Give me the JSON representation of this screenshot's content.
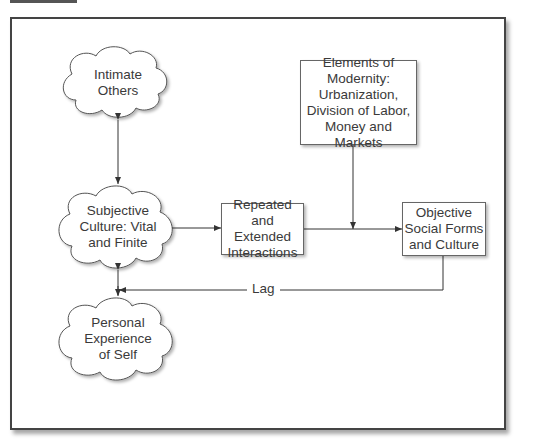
{
  "figure": {
    "header_tab_color": "#555555",
    "frame_border_color": "#444444"
  },
  "nodes": {
    "intimate_others": {
      "shape": "cloud",
      "label": "Intimate Others",
      "lines": [
        "Intimate",
        "Others"
      ]
    },
    "subjective_culture": {
      "shape": "cloud",
      "label": "Subjective Culture: Vital and Finite",
      "lines": [
        "Subjective",
        "Culture: Vital",
        "and Finite"
      ]
    },
    "personal_experience": {
      "shape": "cloud",
      "label": "Personal Experience of Self",
      "lines": [
        "Personal",
        "Experience",
        "of Self"
      ]
    },
    "repeated_interactions": {
      "shape": "box",
      "label": "Repeated and Extended Interactions",
      "lines": [
        "Repeated",
        "and Extended",
        "Interactions"
      ]
    },
    "elements_of_modernity": {
      "shape": "box",
      "label": "Elements of Modernity: Urbanization, Division of Labor, Money and Markets",
      "lines": [
        "Elements of",
        "Modernity:",
        "Urbanization,",
        "Division of Labor,",
        "Money and Markets"
      ]
    },
    "objective_social_forms": {
      "shape": "box",
      "label": "Objective Social Forms and Culture",
      "lines": [
        "Objective",
        "Social Forms",
        "and Culture"
      ]
    }
  },
  "edges": [
    {
      "from": "intimate_others",
      "to": "subjective_culture",
      "type": "bidirectional"
    },
    {
      "from": "subjective_culture",
      "to": "personal_experience",
      "type": "bidirectional"
    },
    {
      "from": "subjective_culture",
      "to": "repeated_interactions",
      "type": "arrow"
    },
    {
      "from": "repeated_interactions",
      "to": "objective_social_forms",
      "type": "arrow"
    },
    {
      "from": "elements_of_modernity",
      "to": "repeated_to_objective_edge",
      "type": "arrow"
    },
    {
      "from": "objective_social_forms",
      "to": "subjective_personal_edge",
      "type": "arrow",
      "label": "Lag"
    }
  ],
  "labels": {
    "lag": "Lag"
  }
}
